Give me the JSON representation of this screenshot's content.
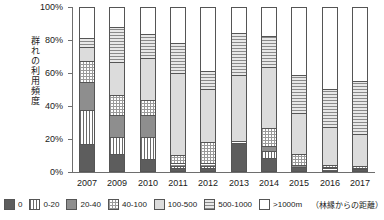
{
  "chart_data": {
    "type": "bar",
    "stacked": true,
    "title": "",
    "xlabel": "",
    "ylabel": "群れの利用頻度",
    "ylim": [
      0,
      100
    ],
    "ytick_labels": [
      "0%",
      "20%",
      "40%",
      "60%",
      "80%",
      "100%"
    ],
    "ytick_values": [
      0,
      20,
      40,
      60,
      80,
      100
    ],
    "grid": false,
    "legend_position": "bottom",
    "legend_note": "（林縁からの距離）",
    "categories": [
      "2007",
      "2009",
      "2010",
      "2011",
      "2012",
      "2013",
      "2014",
      "2015",
      "2016",
      "2017"
    ],
    "series": [
      {
        "name": "0",
        "pattern": "solid-dark-gray",
        "values": [
          16.0,
          10.0,
          6.5,
          1.5,
          1.0,
          16.5,
          7.5,
          2.0,
          1.0,
          0.5
        ]
      },
      {
        "name": "0-20",
        "pattern": "vertical-lines",
        "values": [
          21.0,
          10.5,
          13.5,
          1.0,
          1.5,
          0.0,
          4.0,
          0.0,
          0.5,
          0.5
        ]
      },
      {
        "name": "20-40",
        "pattern": "solid-mid-gray",
        "values": [
          17.0,
          13.5,
          14.0,
          1.5,
          1.5,
          1.0,
          3.5,
          1.0,
          0.5,
          0.5
        ]
      },
      {
        "name": "40-100",
        "pattern": "cross-hatch",
        "values": [
          13.0,
          12.0,
          9.0,
          5.0,
          13.0,
          0.5,
          11.0,
          7.0,
          1.0,
          1.0
        ]
      },
      {
        "name": "100-500",
        "pattern": "solid-light-gray",
        "values": [
          8.5,
          20.5,
          26.0,
          50.5,
          33.0,
          40.5,
          37.5,
          25.0,
          23.5,
          19.5
        ]
      },
      {
        "name": "500-1000",
        "pattern": "horizontal-lines",
        "values": [
          5.5,
          21.0,
          14.5,
          18.5,
          10.5,
          25.5,
          19.0,
          23.0,
          23.5,
          32.5
        ]
      },
      {
        "name": ">1000m",
        "pattern": "white",
        "values": [
          19.0,
          12.5,
          16.5,
          22.0,
          39.5,
          16.0,
          17.5,
          42.0,
          50.0,
          45.5
        ]
      }
    ]
  },
  "legend": {
    "items": [
      {
        "label": "0"
      },
      {
        "label": "0-20"
      },
      {
        "label": "20-40"
      },
      {
        "label": "40-100"
      },
      {
        "label": "100-500"
      },
      {
        "label": "500-1000"
      },
      {
        "label": ">1000m"
      }
    ],
    "note": "（林縁からの距離）"
  }
}
